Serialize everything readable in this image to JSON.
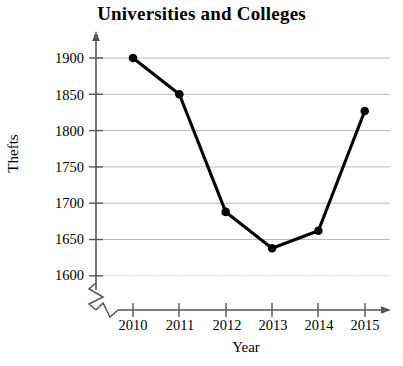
{
  "chart_data": {
    "type": "line",
    "title": "Universities and Colleges",
    "xlabel": "Year",
    "ylabel": "Thefts",
    "categories": [
      "2010",
      "2011",
      "2012",
      "2013",
      "2014",
      "2015"
    ],
    "x": [
      2010,
      2011,
      2012,
      2013,
      2014,
      2015
    ],
    "values": [
      1900,
      1850,
      1688,
      1638,
      1662,
      1827
    ],
    "series": [
      {
        "name": "Thefts",
        "values": [
          1900,
          1850,
          1688,
          1638,
          1662,
          1827
        ]
      }
    ],
    "ytick_labels": [
      "1900",
      "1850",
      "1800",
      "1750",
      "1700",
      "1650",
      "1600"
    ],
    "ytick_values": [
      1900,
      1850,
      1800,
      1750,
      1700,
      1650,
      1600
    ],
    "xtick_labels": [
      "2010",
      "2011",
      "2012",
      "2013",
      "2014",
      "2015"
    ],
    "ylim": [
      1600,
      1900
    ],
    "xlim": [
      2010,
      2015
    ],
    "grid": "horizontal",
    "legend": "none",
    "axis_break_x": true,
    "axis_break_y": true,
    "marker": "filled-circle",
    "line_color": "#000000",
    "grid_color": "#b8b8b8",
    "axis_color": "#555555",
    "background_color": "#ffffff"
  },
  "chart": {
    "title": "Universities and Colleges",
    "ylabel": "Thefts",
    "xlabel": "Year",
    "yticks": [
      "1900",
      "1850",
      "1800",
      "1750",
      "1700",
      "1650",
      "1600"
    ],
    "xticks": [
      "2010",
      "2011",
      "2012",
      "2013",
      "2014",
      "2015"
    ]
  }
}
